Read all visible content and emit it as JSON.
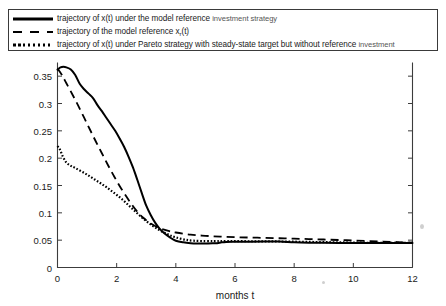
{
  "chart_data": {
    "type": "line",
    "title": "",
    "xlabel": "months t",
    "ylabel": "",
    "xlim": [
      0,
      12
    ],
    "ylim": [
      0,
      0.375
    ],
    "xticks": [
      0,
      2,
      4,
      6,
      8,
      10,
      12
    ],
    "xtick_labels": [
      "0",
      "2",
      "4",
      "6",
      "8",
      "10",
      "12"
    ],
    "yticks": [
      0,
      0.05,
      0.1,
      0.15,
      0.2,
      0.25,
      0.3,
      0.35
    ],
    "ytick_labels": [
      "0",
      "0.05",
      "0.1",
      "0.15",
      "0.2",
      "0.25",
      "0.3",
      "0.35"
    ],
    "grid": false,
    "legend_position": "above-axes",
    "series": [
      {
        "name": "trajectory-solid",
        "style": "solid",
        "color": "#000000",
        "x": [
          0,
          0.1,
          0.2,
          0.3,
          0.45,
          0.6,
          0.75,
          0.9,
          1.05,
          1.2,
          1.35,
          1.5,
          1.65,
          1.8,
          1.95,
          2.1,
          2.25,
          2.4,
          2.55,
          2.7,
          2.85,
          3.0,
          3.15,
          3.3,
          3.45,
          3.6,
          3.8,
          4.0,
          4.25,
          4.5,
          4.75,
          5.0,
          5.25,
          5.4,
          5.55,
          5.7,
          6.0,
          6.5,
          7.0,
          7.5,
          8.0,
          8.5,
          9.0,
          9.5,
          10.0,
          10.5,
          11.0,
          11.5,
          12.0
        ],
        "y": [
          0.362,
          0.366,
          0.367,
          0.366,
          0.362,
          0.352,
          0.336,
          0.326,
          0.318,
          0.31,
          0.297,
          0.286,
          0.274,
          0.262,
          0.25,
          0.236,
          0.221,
          0.203,
          0.183,
          0.16,
          0.136,
          0.113,
          0.096,
          0.082,
          0.071,
          0.063,
          0.055,
          0.049,
          0.046,
          0.0445,
          0.044,
          0.044,
          0.0442,
          0.0445,
          0.046,
          0.0468,
          0.047,
          0.0472,
          0.0474,
          0.0476,
          0.0462,
          0.0455,
          0.0452,
          0.045,
          0.045,
          0.045,
          0.045,
          0.045,
          0.045
        ]
      },
      {
        "name": "model-reference",
        "style": "dashed",
        "color": "#000000",
        "x": [
          0,
          0.15,
          0.3,
          0.5,
          0.7,
          0.9,
          1.1,
          1.3,
          1.5,
          1.7,
          1.9,
          2.1,
          2.3,
          2.5,
          2.7,
          2.9,
          3.1,
          3.3,
          3.5,
          3.75,
          4.0,
          4.5,
          5.0,
          5.5,
          6.0,
          6.5,
          7.0,
          7.5,
          8.0,
          8.5,
          9.0,
          9.5,
          10.0,
          10.5,
          11.0,
          11.5,
          12.0
        ],
        "y": [
          0.364,
          0.352,
          0.337,
          0.317,
          0.296,
          0.274,
          0.252,
          0.23,
          0.209,
          0.188,
          0.168,
          0.149,
          0.132,
          0.116,
          0.102,
          0.091,
          0.082,
          0.076,
          0.071,
          0.067,
          0.064,
          0.06,
          0.058,
          0.0565,
          0.0555,
          0.0548,
          0.0542,
          0.0535,
          0.0528,
          0.052,
          0.0512,
          0.0503,
          0.0495,
          0.0485,
          0.0475,
          0.0465,
          0.0455
        ]
      },
      {
        "name": "pareto-no-reference",
        "style": "dotted",
        "color": "#000000",
        "x": [
          0,
          0.08,
          0.18,
          0.3,
          0.45,
          0.6,
          0.8,
          1.0,
          1.2,
          1.4,
          1.6,
          1.8,
          2.0,
          2.2,
          2.4,
          2.6,
          2.8,
          3.0,
          3.2,
          3.4,
          3.6,
          3.8,
          4.0,
          4.3,
          4.6,
          5.0,
          5.3,
          5.5,
          5.7,
          6.0,
          6.5,
          7.0,
          7.5,
          8.0,
          8.5,
          9.0,
          9.5,
          10.0,
          10.5,
          11.0,
          11.5,
          12.0
        ],
        "y": [
          0.222,
          0.216,
          0.203,
          0.192,
          0.186,
          0.182,
          0.176,
          0.17,
          0.163,
          0.156,
          0.149,
          0.141,
          0.133,
          0.124,
          0.114,
          0.104,
          0.094,
          0.085,
          0.077,
          0.07,
          0.064,
          0.059,
          0.055,
          0.051,
          0.049,
          0.0482,
          0.0481,
          0.0482,
          0.0483,
          0.0482,
          0.048,
          0.0478,
          0.0476,
          0.0472,
          0.0468,
          0.0464,
          0.046,
          0.0456,
          0.0453,
          0.0451,
          0.045,
          0.045
        ]
      }
    ]
  },
  "legend": {
    "items": [
      {
        "sample": "solid-line-sample",
        "text_main": "trajectory of x(t) under the model reference ",
        "text_faded": "investment  strategy"
      },
      {
        "sample": "dashed-line-sample",
        "text_main": "trajectory of the model reference x",
        "text_sub": "r",
        "text_tail": "(t)"
      },
      {
        "sample": "dotted-line-sample",
        "text_main": "trajectory of x(t) under Pareto strategy with steady-state target but without reference ",
        "text_faded": "investment"
      }
    ]
  }
}
